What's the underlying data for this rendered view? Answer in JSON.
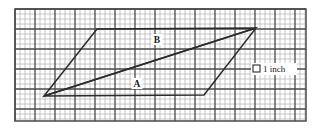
{
  "figure": {
    "background_color": "#ffffff",
    "grid": {
      "minor_cell_px": 5,
      "major_every": 4,
      "minor_color": "#b9b9b9",
      "major_color": "#4a4a4a",
      "frame_color": "#4a4a4a",
      "x0": 15,
      "y0": 9,
      "x1": 306,
      "y1": 121,
      "cols": 58,
      "rows": 22
    },
    "shapes": {
      "stroke_color": "#2b2b2b",
      "stroke_width": 1.5,
      "triangle_a": {
        "name": "triangle-a",
        "label": "A",
        "points": "44,96 97,29 256,28"
      },
      "triangle_b": {
        "name": "triangle-b",
        "label": "B",
        "points": "44,96 204,95 256,28"
      }
    },
    "labels": {
      "a": {
        "text": "A",
        "x": 137,
        "y": 87
      },
      "b": {
        "text": "B",
        "x": 157,
        "y": 43
      }
    },
    "legend": {
      "swatch_name": "one-inch-square-swatch",
      "swatch": {
        "x": 253,
        "y": 65,
        "size": 7
      },
      "text": "1 inch",
      "text_x": 263,
      "text_y": 72
    }
  }
}
